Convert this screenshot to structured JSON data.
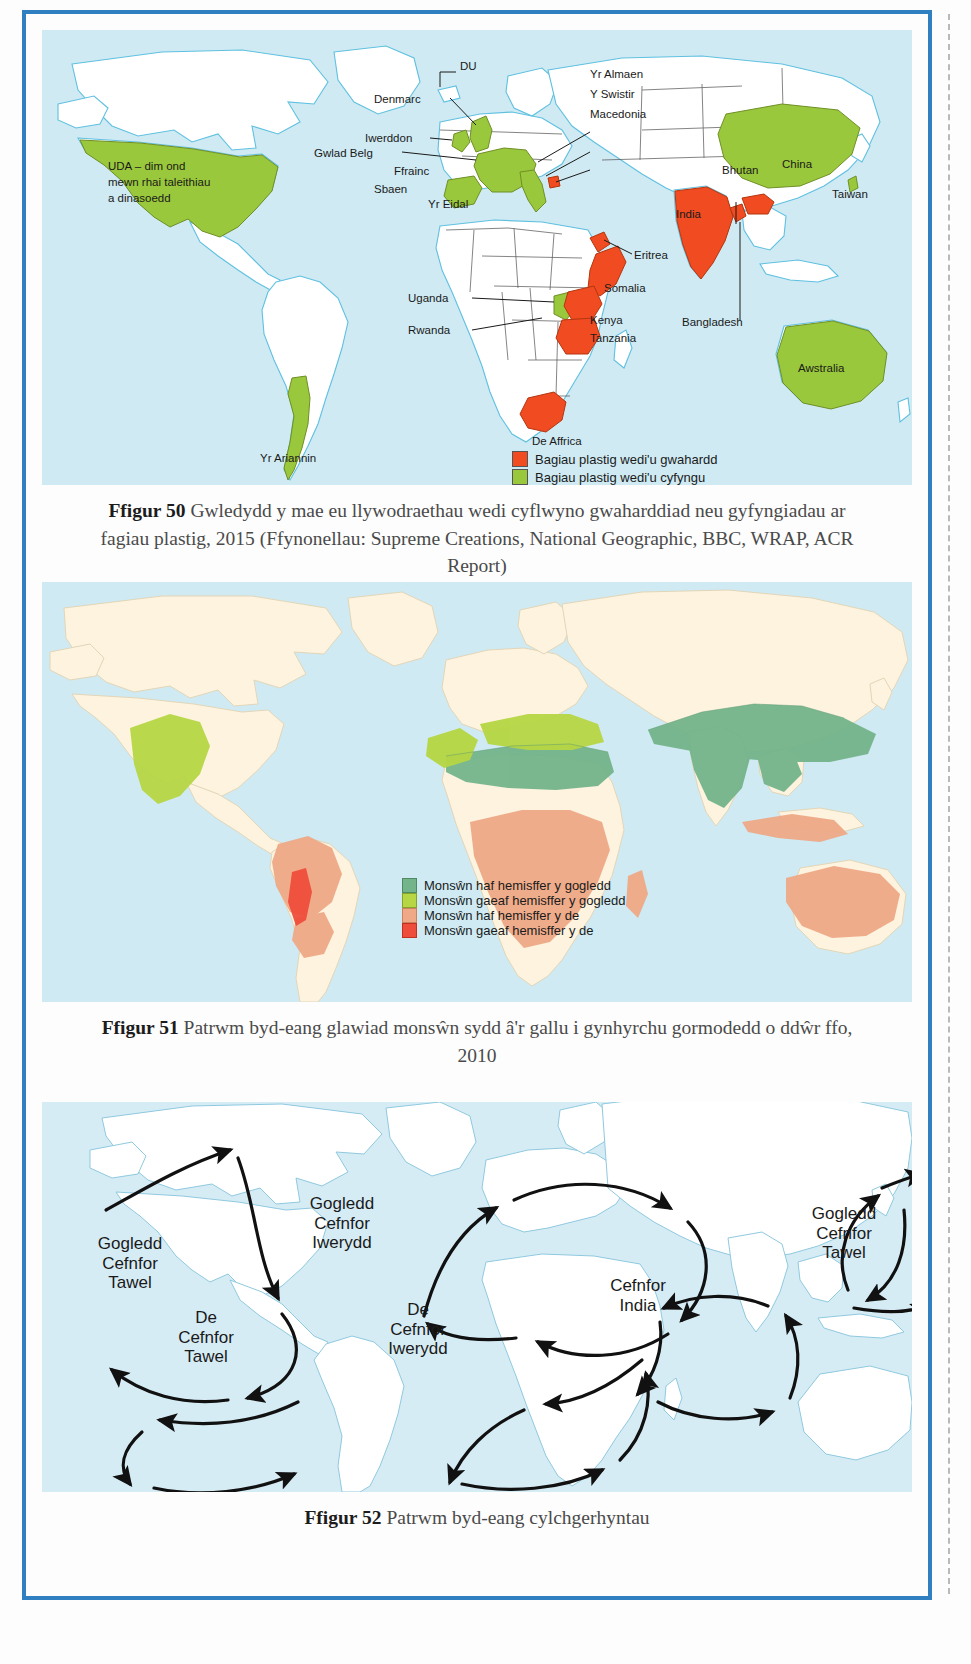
{
  "page": {
    "background_color": "#fdfdfd",
    "frame_color": "#2f7fc1"
  },
  "figures": [
    {
      "id": "figure-50",
      "number": "Ffigur 50",
      "caption_text": "Gwledydd y mae eu llywodraethau wedi cyflwyno gwaharddiad neu gyfyngiadau ar fagiau plastig, 2015 (Ffynonellau: Supreme Creations, National Geographic, BBC, WRAP, ACR Report)",
      "map_type": "world-choropleth",
      "ocean_color": "#cfeaf3",
      "land_color": "#ffffff",
      "colors": {
        "banned": "#f04b21",
        "restricted": "#9ac83c"
      },
      "legend": [
        {
          "swatch": "#f04b21",
          "label": "Bagiau plastig wedi'u gwahardd"
        },
        {
          "swatch": "#9ac83c",
          "label": "Bagiau plastig wedi'u cyfyngu"
        }
      ],
      "annotations": [
        {
          "name": "usa",
          "text": "UDA – dim ond mewn rhai taleithiau a dinasoedd"
        },
        {
          "name": "du",
          "text": "DU"
        },
        {
          "name": "denmarc",
          "text": "Denmarc"
        },
        {
          "name": "iwerddon",
          "text": "Iwerddon"
        },
        {
          "name": "gwlad-belg",
          "text": "Gwlad Belg"
        },
        {
          "name": "ffrainc",
          "text": "Ffrainc"
        },
        {
          "name": "sbaen",
          "text": "Sbaen"
        },
        {
          "name": "yr-eidal",
          "text": "Yr Eidal"
        },
        {
          "name": "yr-almaen",
          "text": "Yr Almaen"
        },
        {
          "name": "y-swistir",
          "text": "Y Swistir"
        },
        {
          "name": "macedonia",
          "text": "Macedonia"
        },
        {
          "name": "bhutan",
          "text": "Bhutan"
        },
        {
          "name": "china",
          "text": "China"
        },
        {
          "name": "taiwan",
          "text": "Taiwan"
        },
        {
          "name": "india",
          "text": "India"
        },
        {
          "name": "bangladesh",
          "text": "Bangladesh"
        },
        {
          "name": "eritrea",
          "text": "Eritrea"
        },
        {
          "name": "somalia",
          "text": "Somalia"
        },
        {
          "name": "uganda",
          "text": "Uganda"
        },
        {
          "name": "rwanda",
          "text": "Rwanda"
        },
        {
          "name": "kenya",
          "text": "Kenya"
        },
        {
          "name": "tanzania",
          "text": "Tanzania"
        },
        {
          "name": "de-affrica",
          "text": "De Affrica"
        },
        {
          "name": "yr-ariannin",
          "text": "Yr Ariannin"
        },
        {
          "name": "awstralia",
          "text": "Awstralia"
        }
      ]
    },
    {
      "id": "figure-51",
      "number": "Ffigur 51",
      "caption_text": "Patrwm byd-eang glawiad monsŵn sydd â'r gallu i gynhyrchu gormodedd o ddŵr ffo, 2010",
      "map_type": "world-thematic",
      "ocean_color": "#cfeaf3",
      "land_color": "#fdf3df",
      "colors": {
        "nh_summer": "#74b48a",
        "nh_winter": "#b6d643",
        "sh_summer": "#efa986",
        "sh_winter": "#ef4d3c"
      },
      "legend": [
        {
          "swatch": "#74b48a",
          "label": "Monsŵn haf hemisffer y gogledd"
        },
        {
          "swatch": "#b6d643",
          "label": "Monsŵn gaeaf hemisffer y gogledd"
        },
        {
          "swatch": "#efa986",
          "label": "Monsŵn haf hemisffer y de"
        },
        {
          "swatch": "#ef4d3c",
          "label": "Monsŵn gaeaf hemisffer y de"
        }
      ]
    },
    {
      "id": "figure-52",
      "number": "Ffigur 52",
      "caption_text": "Patrwm byd-eang cylchgerhyntau",
      "map_type": "world-currents",
      "ocean_color": "#d6ecf5",
      "land_color": "#ffffff",
      "gyre_labels": [
        {
          "name": "north-pacific-west",
          "text": "Gogledd\nCefnfor\nTawel"
        },
        {
          "name": "north-atlantic",
          "text": "Gogledd\nCefnfor\nIwerydd"
        },
        {
          "name": "north-pacific-east",
          "text": "Gogledd\nCefnfor\nTawel"
        },
        {
          "name": "south-pacific",
          "text": "De\nCefnfor\nTawel"
        },
        {
          "name": "south-atlantic",
          "text": "De\nCefnfor\nIwerydd"
        },
        {
          "name": "indian-ocean",
          "text": "Cefnfor\nIndia"
        }
      ]
    }
  ]
}
